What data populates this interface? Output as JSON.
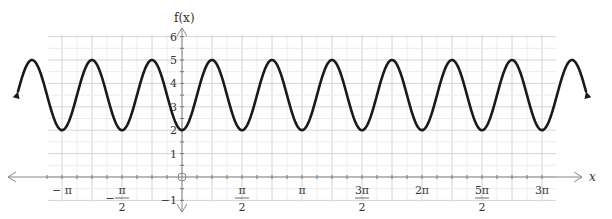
{
  "chart_data": {
    "type": "line",
    "title": "",
    "function": "f(x) = 3.5 - 1.5cos(4x)",
    "xlabel": "x",
    "ylabel": "f(x)",
    "xlim": [
      -3.6,
      3.45
    ],
    "ylim": [
      -1,
      6
    ],
    "grid": true,
    "x_ticks": [
      "−π",
      "−π/2",
      "π/2",
      "π",
      "3π/2",
      "2π",
      "5π/2",
      "3π"
    ],
    "y_ticks": [
      "−1",
      "1",
      "2",
      "3",
      "4",
      "5",
      "6"
    ],
    "origin_label": "O",
    "series": [
      {
        "name": "f(x)",
        "max": 5,
        "min": 2,
        "period": "π/2",
        "minima_x": [
          "−π",
          "−π/2",
          "0",
          "π/2",
          "π",
          "3π/2",
          "2π",
          "5π/2",
          "3π"
        ],
        "maxima_x": [
          "−5π/4",
          "−3π/4",
          "−π/4",
          "π/4",
          "3π/4",
          "5π/4",
          "7π/4",
          "9π/4",
          "11π/4",
          "13π/4"
        ],
        "arrows_both_ends": true
      }
    ]
  },
  "labels": {
    "y_axis_title": "f(x)",
    "x_axis_title": "x",
    "x_ticks": [
      {
        "num": "− π",
        "den": "",
        "pos": -1.0
      },
      {
        "num": "π",
        "den": "2",
        "neg": true,
        "pos": -0.5
      },
      {
        "num": "π",
        "den": "2",
        "pos": 0.5
      },
      {
        "num": "π",
        "den": "",
        "pos": 1.0
      },
      {
        "num": "3π",
        "den": "2",
        "pos": 1.5
      },
      {
        "num": "2π",
        "den": "",
        "pos": 2.0
      },
      {
        "num": "5π",
        "den": "2",
        "pos": 2.5
      },
      {
        "num": "3π",
        "den": "",
        "pos": 3.0
      }
    ],
    "y_ticks": [
      "6",
      "5",
      "4",
      "3",
      "2",
      "1",
      "−1"
    ]
  }
}
